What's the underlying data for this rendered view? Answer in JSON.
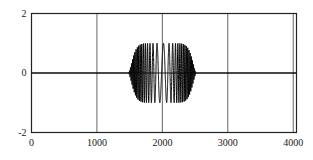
{
  "chart_data": {
    "type": "line",
    "title": "",
    "xlabel": "",
    "ylabel": "",
    "xlim": [
      0,
      4050
    ],
    "ylim": [
      -2,
      2
    ],
    "grid": true,
    "legend": null,
    "xticks": [
      0,
      1000,
      2000,
      3000,
      4000
    ],
    "xticklabels": [
      "0",
      "1000",
      "2000",
      "3000",
      "4000"
    ],
    "yticks": [
      -2,
      0,
      2
    ],
    "yticklabels": [
      "-2",
      "0",
      "2"
    ],
    "series": [
      {
        "name": "chirp-burst",
        "color": "#000000",
        "linewidth": 1,
        "envelope_amplitude": 1.0,
        "burst_start": 1480,
        "burst_end": 2530,
        "burst_center": 2000,
        "center_period": 120,
        "edge_period": 14,
        "baseline_value": 0
      }
    ]
  },
  "axes": {
    "frame_color": "#222222",
    "grid_color": "#555555",
    "zero_line_color": "#222222",
    "background": "#ffffff"
  }
}
